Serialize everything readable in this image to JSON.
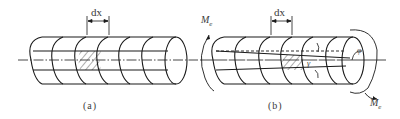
{
  "figure": {
    "panels": [
      {
        "id": "a",
        "caption": "(a)",
        "dimension_label": "dx",
        "description": "undeformed circular shaft with grid of circumferential sections and longitudinal lines; hatched element of length dx"
      },
      {
        "id": "b",
        "caption": "(b)",
        "dimension_label": "dx",
        "moment_label_left": "M",
        "moment_label_left_sub": "e",
        "moment_label_right": "M",
        "moment_label_right_sub": "e",
        "shear_strain_label": "γ",
        "twist_angle_label": "φ",
        "description": "shaft twisted by end torques Me; longitudinal lines become inclined, hatched element sheared by angle γ, end rotated by angle φ"
      }
    ],
    "colors": {
      "stroke": "#1a1a1a",
      "text": "#3a3a3a",
      "background": "#ffffff"
    }
  }
}
